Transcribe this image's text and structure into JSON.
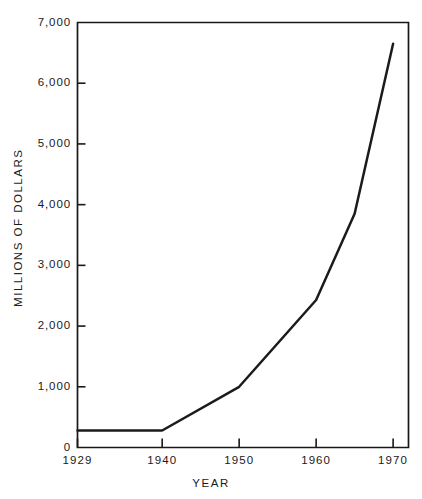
{
  "page": {
    "header_remnant": "",
    "background_color": "#ffffff",
    "ink_color": "#1b1b1d"
  },
  "chart_data": {
    "type": "line",
    "title": "",
    "xlabel": "YEAR",
    "ylabel": "MILLIONS OF DOLLARS",
    "x": [
      1929,
      1940,
      1950,
      1960,
      1965,
      1970
    ],
    "values": [
      280,
      280,
      1000,
      2430,
      3850,
      6650
    ],
    "series": [
      {
        "name": "Millions of dollars",
        "values": [
          280,
          280,
          1000,
          2430,
          3850,
          6650
        ]
      }
    ],
    "xlim": [
      1929,
      1972
    ],
    "ylim": [
      0,
      7000
    ],
    "ytick_values": [
      0,
      1000,
      2000,
      3000,
      4000,
      5000,
      6000,
      7000
    ],
    "ytick_labels": [
      "0",
      "1,000",
      "2,000",
      "3,000",
      "4,000",
      "5,000",
      "6,000",
      "7,000"
    ],
    "xtick_values": [
      1929,
      1940,
      1950,
      1960,
      1970
    ],
    "xtick_labels": [
      "1929",
      "1940",
      "1950",
      "1960",
      "1970"
    ],
    "grid": false,
    "legend": false,
    "line_color": "#1b1b1d"
  }
}
